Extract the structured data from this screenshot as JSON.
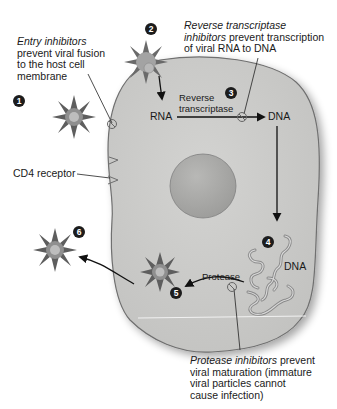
{
  "figure": {
    "colors": {
      "background": "#ffffff",
      "cell_fill": "#c9c9c7",
      "cell_stroke": "#6f6f6f",
      "nucleus_fill": "#a9a9a7",
      "virus_spikes": "#5e5e5e",
      "virus_core": "#9a9a9a",
      "virus_center": "#bdbdbd",
      "text": "#1a1a1a",
      "step_marker": "#1c1c1c"
    }
  },
  "steps": [
    {
      "number": "1"
    },
    {
      "number": "2"
    },
    {
      "number": "3"
    },
    {
      "number": "4"
    },
    {
      "number": "5"
    },
    {
      "number": "6"
    }
  ],
  "labels": {
    "rna": "RNA",
    "dna_top": "DNA",
    "dna_bottom": "DNA",
    "reverse_transcriptase_line1": "Reverse",
    "reverse_transcriptase_line2": "transcriptase",
    "protease": "Protease",
    "cd4_receptor": "CD4 receptor"
  },
  "annotations": {
    "entry": {
      "italic": "Entry inhibitors",
      "line2": "prevent viral fusion",
      "line3": "to the host cell",
      "line4": "membrane"
    },
    "reverse_transcriptase": {
      "italic_line1": "Reverse transcriptase",
      "italic_line2": "inhibitors",
      "rest_line2": " prevent transcription",
      "line3": "of viral RNA to DNA"
    },
    "protease": {
      "italic": "Protease inhibitors",
      "rest_line1": " prevent",
      "line2": "viral maturation (immature",
      "line3": "viral particles cannot",
      "line4": "cause infection)"
    }
  }
}
